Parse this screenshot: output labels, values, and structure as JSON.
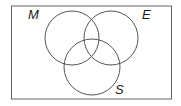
{
  "diagram": {
    "type": "venn",
    "universal_set": {
      "x": 11.5,
      "y": 6,
      "width": 160,
      "height": 93
    },
    "sets": [
      {
        "label": "M",
        "cx": 72,
        "cy": 38,
        "r": 27,
        "label_x": 28,
        "label_y": 19
      },
      {
        "label": "E",
        "cx": 111,
        "cy": 38,
        "r": 27,
        "label_x": 142,
        "label_y": 19
      },
      {
        "label": "S",
        "cx": 92,
        "cy": 67,
        "r": 28,
        "label_x": 115,
        "label_y": 94
      }
    ],
    "stroke_color": "#555555"
  }
}
